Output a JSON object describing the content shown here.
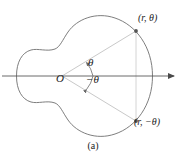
{
  "figure": {
    "caption": "(a)",
    "origin_label": "O",
    "point_top_label": "(r, θ)",
    "point_bottom_label": "(r, −θ)",
    "angle_pos_label": "θ",
    "angle_neg_label": "−θ",
    "colors": {
      "curve": "#6f6f6f",
      "axis": "#5a5a5a",
      "ray": "#c9c9c9",
      "connector": "#cfcfcf",
      "text": "#222222",
      "marker": "#555555",
      "background": "#ffffff"
    }
  },
  "chart_data": {
    "type": "line",
    "title": "",
    "subtitle": "",
    "xlabel": "",
    "ylabel": "",
    "grid": false,
    "legend": "none",
    "origin": {
      "x": 62,
      "y": 76
    },
    "axis": {
      "x_start": 2,
      "x_end": 181,
      "y": 76,
      "arrow": "right"
    },
    "points": [
      {
        "name": "(r, θ)",
        "x": 136,
        "y": 31
      },
      {
        "name": "(r, −θ)",
        "x": 136,
        "y": 121
      }
    ],
    "rays": [
      {
        "from": [
          62,
          76
        ],
        "to": [
          136,
          31
        ]
      },
      {
        "from": [
          62,
          76
        ],
        "to": [
          136,
          121
        ]
      }
    ],
    "connector": {
      "from": [
        136,
        31
      ],
      "to": [
        136,
        121
      ]
    },
    "angle_arcs": [
      {
        "label": "θ",
        "sweep": "counterclockwise",
        "cx": 62,
        "cy": 76
      },
      {
        "label": "−θ",
        "sweep": "clockwise",
        "cx": 62,
        "cy": 76
      }
    ],
    "curve_path": "M 152.5 76 C 152.5 47 136 25 115 18 C 96 11.5 77 19 68 32 C 62.5 40 60 47 55 49 C 47 52 38 48 31 50 C 22 52.5 16.5 62 16.5 76 C 16.5 90 22 99.5 31 102 C 38 104 47 100 55 103 C 60 105 62.5 112 68 120 C 77 133 96 140.5 115 134 C 136 127 152.5 105 152.5 76 Z"
  }
}
